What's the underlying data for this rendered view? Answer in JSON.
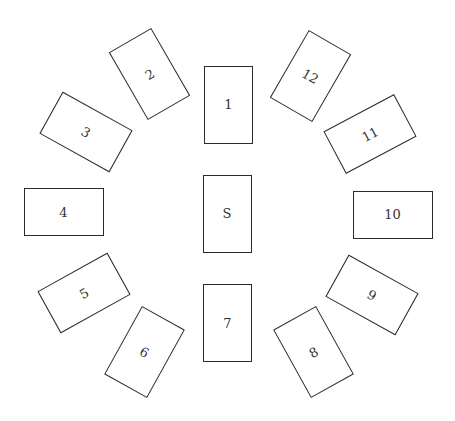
{
  "diagram": {
    "type": "tarot-card-spread",
    "cards": [
      {
        "label": "1",
        "orientation": "portrait",
        "cx": 228.5,
        "cy": 104.5,
        "rotation": 0
      },
      {
        "label": "2",
        "orientation": "portrait",
        "cx": 149.5,
        "cy": 74,
        "rotation": -30
      },
      {
        "label": "3",
        "orientation": "landscape",
        "cx": 85.5,
        "cy": 131.5,
        "rotation": 29
      },
      {
        "label": "4",
        "orientation": "landscape",
        "cx": 63.5,
        "cy": 212,
        "rotation": 0
      },
      {
        "label": "5",
        "orientation": "landscape",
        "cx": 84,
        "cy": 292.5,
        "rotation": -29
      },
      {
        "label": "6",
        "orientation": "portrait",
        "cx": 144.5,
        "cy": 351.5,
        "rotation": 29
      },
      {
        "label": "7",
        "orientation": "portrait",
        "cx": 227.5,
        "cy": 323,
        "rotation": 0
      },
      {
        "label": "8",
        "orientation": "portrait",
        "cx": 313.5,
        "cy": 351.5,
        "rotation": -29
      },
      {
        "label": "9",
        "orientation": "landscape",
        "cx": 371.5,
        "cy": 294.5,
        "rotation": 29
      },
      {
        "label": "10",
        "orientation": "landscape",
        "cx": 392.5,
        "cy": 214.5,
        "rotation": 0
      },
      {
        "label": "11",
        "orientation": "landscape",
        "cx": 370,
        "cy": 134,
        "rotation": -28
      },
      {
        "label": "12",
        "orientation": "portrait",
        "cx": 310.5,
        "cy": 75.5,
        "rotation": 30
      },
      {
        "label": "S",
        "orientation": "portrait",
        "cx": 227,
        "cy": 213.5,
        "rotation": 0
      }
    ],
    "colors": {
      "background": "#ffffff",
      "card_border": "#2a2a2a",
      "label": "#333333"
    }
  }
}
